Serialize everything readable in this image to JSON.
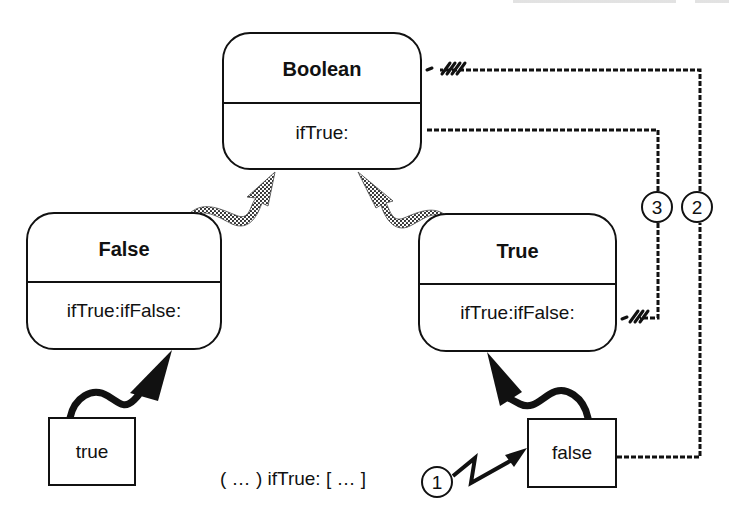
{
  "diagram": {
    "classes": {
      "boolean": {
        "name": "Boolean",
        "method": "ifTrue:"
      },
      "false": {
        "name": "False",
        "method": "ifTrue:ifFalse:"
      },
      "true": {
        "name": "True",
        "method": "ifTrue:ifFalse:"
      }
    },
    "instances": {
      "true": {
        "label": "true"
      },
      "false": {
        "label": "false"
      }
    },
    "message_expression": "( … ) ifTrue: [ … ]",
    "steps": [
      {
        "number": "1",
        "meaning": "message sent to false instance"
      },
      {
        "number": "2",
        "meaning": "lookup from false to Boolean"
      },
      {
        "number": "3",
        "meaning": "Boolean ifTrue: invokes True ifTrue:ifFalse:"
      }
    ],
    "relations": [
      {
        "type": "inheritance",
        "from": "False",
        "to": "Boolean",
        "style": "halftone-wavy-arrow"
      },
      {
        "type": "inheritance",
        "from": "True",
        "to": "Boolean",
        "style": "halftone-wavy-arrow"
      },
      {
        "type": "instance-of",
        "from": "true",
        "to": "False",
        "style": "solid-wavy-arrow"
      },
      {
        "type": "instance-of",
        "from": "false",
        "to": "True",
        "style": "solid-wavy-arrow"
      },
      {
        "type": "message-send",
        "from": "expression",
        "to": "false",
        "style": "zigzag-arrow",
        "step": "1"
      },
      {
        "type": "method-lookup",
        "from": "false",
        "to": "Boolean",
        "style": "hatched-dashed-line",
        "step": "2"
      },
      {
        "type": "method-call",
        "from": "Boolean.ifTrue:",
        "to": "True.ifTrue:ifFalse:",
        "style": "hatched-dashed-line",
        "step": "3"
      }
    ],
    "colors": {
      "ink": "#111111",
      "background": "#ffffff",
      "halftone": "#555555"
    }
  }
}
